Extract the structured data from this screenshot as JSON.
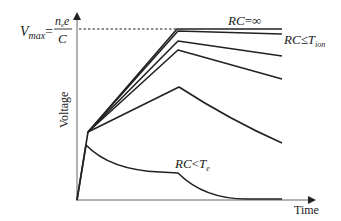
{
  "diagram": {
    "type": "voltage-vs-time pulse shapes for varying RC",
    "x_axis_label": "Time",
    "y_axis_label": "Voltage",
    "vmax_label": {
      "lhs": "V",
      "lhs_sub": "max",
      "equals": "=",
      "numerator_n": "n",
      "numerator_sub": "e",
      "numerator_e": "e",
      "denominator": "C"
    },
    "annotations": {
      "rc_infinite": {
        "lhs": "RC",
        "op": "=",
        "rhs": "∞"
      },
      "rc_le_tion": {
        "lhs": "RC",
        "op": "≤",
        "rhs": "T",
        "rhs_sub": "ion"
      },
      "rc_lt_te": {
        "lhs": "RC",
        "op": "<",
        "rhs": "T",
        "rhs_sub": "e"
      }
    },
    "curves": [
      {
        "name": "rc-infinite",
        "description": "rises fast, rises slowly to Vmax, then flat"
      },
      {
        "name": "rc-le-tion",
        "description": "rises to Vmax, very slight decay"
      },
      {
        "name": "rc-medium-1",
        "description": "rises to near Vmax then moderate decay"
      },
      {
        "name": "rc-medium-2",
        "description": "rises then steeper decay"
      },
      {
        "name": "rc-small",
        "description": "lower peak then strong decay"
      },
      {
        "name": "rc-lt-te",
        "description": "fast spike then exponential decay to baseline"
      }
    ]
  }
}
